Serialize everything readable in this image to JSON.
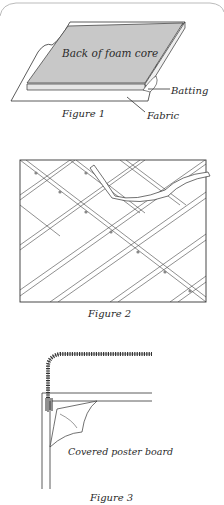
{
  "figure1": {
    "caption": "Figure 1",
    "labels": {
      "foam": "Back of foam core",
      "batting": "Batting",
      "fabric": "Fabric"
    },
    "colors": {
      "foam": "#c8c8c8",
      "line": "#333333"
    }
  },
  "figure2": {
    "caption": "Figure 2"
  },
  "figure3": {
    "caption": "Figure 3",
    "labels": {
      "board": "Covered poster board"
    }
  }
}
